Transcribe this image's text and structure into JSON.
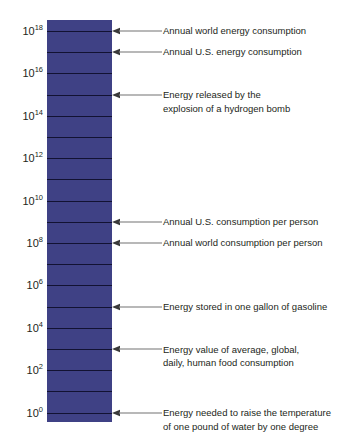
{
  "chart_data": {
    "type": "bar",
    "title": "",
    "subtitle": "",
    "xlabel": "",
    "ylabel": "",
    "orientation": "vertical",
    "scale": "log10",
    "units": "joules",
    "ylim": [
      1,
      1000000000000000000
    ],
    "grid": true,
    "legend": false,
    "bar_color": "#3f4185",
    "grid_line_color": "#121232",
    "text_color": "#231f20",
    "tick_labels": [
      {
        "base": "10",
        "exponent": "18",
        "value": 18
      },
      {
        "base": "10",
        "exponent": "16",
        "value": 16
      },
      {
        "base": "10",
        "exponent": "14",
        "value": 14
      },
      {
        "base": "10",
        "exponent": "12",
        "value": 12
      },
      {
        "base": "10",
        "exponent": "10",
        "value": 10
      },
      {
        "base": "10",
        "exponent": "8",
        "value": 8
      },
      {
        "base": "10",
        "exponent": "6",
        "value": 6
      },
      {
        "base": "10",
        "exponent": "4",
        "value": 4
      },
      {
        "base": "10",
        "exponent": "2",
        "value": 2
      },
      {
        "base": "10",
        "exponent": "0",
        "value": 0
      }
    ],
    "annotations": [
      {
        "line1": "Annual world energy consumption",
        "line2": "",
        "exponent": 18
      },
      {
        "line1": "Annual U.S. energy consumption",
        "line2": "",
        "exponent": 17
      },
      {
        "line1": "Energy released by the",
        "line2": "explosion of a hydrogen bomb",
        "exponent": 15
      },
      {
        "line1": "Annual U.S. consumption per person",
        "line2": "",
        "exponent": 9
      },
      {
        "line1": "Annual world consumption per person",
        "line2": "",
        "exponent": 8
      },
      {
        "line1": "Energy stored in one gallon of gasoline",
        "line2": "",
        "exponent": 5
      },
      {
        "line1": "Energy value of average, global,",
        "line2": "daily, human food consumption",
        "exponent": 3
      },
      {
        "line1": "Energy needed to raise the temperature",
        "line2": "of one pound of water by one degree",
        "exponent": 0
      }
    ]
  },
  "geometry": {
    "bar_left": 47,
    "bar_top": 20,
    "bar_width": 65,
    "bar_height": 402,
    "decade_step": 21.2,
    "first_line_y": 31
  }
}
